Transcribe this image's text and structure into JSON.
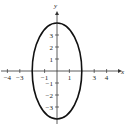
{
  "chart_data": {
    "type": "line",
    "title": "",
    "xlabel": "x",
    "ylabel": "y",
    "xlim": [
      -4.5,
      5
    ],
    "ylim": [
      -4,
      4.5
    ],
    "grid": false,
    "legend": null,
    "x_ticks": [
      -4,
      -3,
      -1,
      1,
      3,
      4
    ],
    "x_tick_labels": [
      "−4",
      "−3",
      "−1",
      "1",
      "3",
      "4"
    ],
    "y_ticks": [
      3,
      2,
      1,
      -1,
      -2,
      -3
    ],
    "y_tick_labels": [
      "3",
      "2",
      "1",
      "−1",
      "−2",
      "−3"
    ],
    "series": [
      {
        "name": "ellipse",
        "equation": "x^2/4 + y^2/16 = 1",
        "center": [
          0,
          0
        ],
        "semi_axis_x": 2,
        "semi_axis_y": 4,
        "color": "#111111"
      }
    ]
  },
  "axes": {
    "x_label": "x",
    "y_label": "y"
  }
}
